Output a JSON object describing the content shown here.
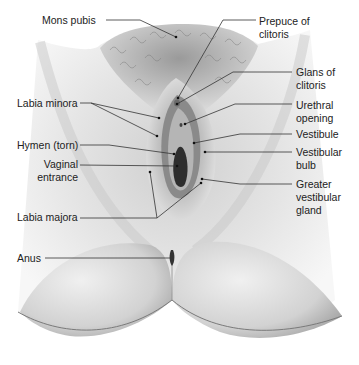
{
  "figure": {
    "colors": {
      "background": "#ffffff",
      "skin_light": "#e6e6e6",
      "skin_mid": "#b8b8b8",
      "skin_dark": "#555555",
      "label_text": "#222222",
      "leader_line": "#333333"
    }
  },
  "labels": {
    "left": [
      {
        "id": "mons-pubis",
        "text": "Mons pubis",
        "x": 42,
        "y": 14,
        "line": [
          [
            106,
            20
          ],
          [
            140,
            20
          ],
          [
            176,
            37
          ]
        ]
      },
      {
        "id": "labia-minora",
        "text": "Labia minora",
        "x": 17,
        "y": 97,
        "line": [
          [
            80,
            103
          ],
          [
            91,
            103
          ],
          [
            159,
            118
          ]
        ],
        "line2": [
          [
            91,
            103
          ],
          [
            157,
            136
          ]
        ]
      },
      {
        "id": "hymen-torn",
        "text": "Hymen (torn)",
        "x": 17,
        "y": 139,
        "line": [
          [
            80,
            145
          ],
          [
            109,
            145
          ],
          [
            174,
            154
          ]
        ]
      },
      {
        "id": "vaginal-entrance",
        "text": "Vaginal\nentrance",
        "x": 36,
        "y": 158,
        "align": "right",
        "line": [
          [
            80,
            165
          ],
          [
            177,
            166
          ]
        ]
      },
      {
        "id": "labia-majora",
        "text": "Labia majora",
        "x": 17,
        "y": 211,
        "line": [
          [
            80,
            218
          ],
          [
            157,
            218
          ],
          [
            150,
            172
          ]
        ],
        "line2": [
          [
            157,
            218
          ],
          [
            201,
            183
          ]
        ]
      },
      {
        "id": "anus",
        "text": "Anus",
        "x": 17,
        "y": 252,
        "line": [
          [
            45,
            258
          ],
          [
            171,
            258
          ]
        ]
      }
    ],
    "right": [
      {
        "id": "prepuce-of-clitoris",
        "text": "Prepuce of\nclitoris",
        "x": 259,
        "y": 15,
        "line": [
          [
            256,
            20
          ],
          [
            223,
            20
          ],
          [
            178,
            98
          ]
        ]
      },
      {
        "id": "glans-of-clitoris",
        "text": "Glans of\nclitoris",
        "x": 296,
        "y": 66,
        "line": [
          [
            292,
            72
          ],
          [
            233,
            72
          ],
          [
            177,
            104
          ]
        ]
      },
      {
        "id": "urethral-opening",
        "text": "Urethral\nopening",
        "x": 296,
        "y": 99,
        "line": [
          [
            292,
            104
          ],
          [
            235,
            104
          ],
          [
            185,
            124
          ]
        ]
      },
      {
        "id": "vestibule",
        "text": "Vestibule",
        "x": 296,
        "y": 131,
        "line": [
          [
            292,
            134
          ],
          [
            240,
            134
          ],
          [
            194,
            143
          ]
        ]
      },
      {
        "id": "vestibular-bulb",
        "text": "Vestibular\nbulb",
        "x": 296,
        "y": 149,
        "line": [
          [
            292,
            152
          ],
          [
            205,
            152
          ]
        ]
      },
      {
        "id": "greater-vestibular-gland",
        "text": "Greater\nvestibular\ngland",
        "x": 296,
        "y": 179,
        "line": [
          [
            292,
            184
          ],
          [
            240,
            184
          ],
          [
            202,
            179
          ]
        ]
      }
    ]
  }
}
